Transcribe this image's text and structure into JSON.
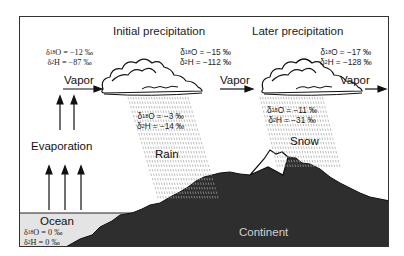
{
  "diagram": {
    "stages": {
      "initial": {
        "title": "Initial precipitation"
      },
      "later": {
        "title": "Later precipitation"
      }
    },
    "labels": {
      "vapor1": "Vapor",
      "vapor2": "Vapor",
      "vapor3": "Vapor",
      "evaporation": "Evaporation",
      "rain": "Rain",
      "snow": "Snow",
      "ocean": "Ocean",
      "continent": "Continent"
    },
    "values": {
      "vapor_start": {
        "o18": "= −12 ‰",
        "h2": "= −87 ‰"
      },
      "vapor_mid": {
        "o18": "= −15 ‰",
        "h2": "= −112 ‰"
      },
      "vapor_end": {
        "o18": "= −17 ‰",
        "h2": "= −128 ‰"
      },
      "rain": {
        "o18": "= −3 ‰",
        "h2": "= −14 ‰"
      },
      "snow": {
        "o18": "= −11 ‰",
        "h2": "= −31 ‰"
      },
      "ocean": {
        "o18": "= 0 ‰",
        "h2": "= 0 ‰"
      }
    },
    "symbols": {
      "delta": "δ",
      "o18_sup": "18",
      "o_elem": "O",
      "h2_sup": "2",
      "h_elem": "H"
    },
    "colors": {
      "continent": "#2e2e2e",
      "ocean": "#e4e4e4",
      "outline": "#111111",
      "rain": "#9a9a9a"
    }
  }
}
